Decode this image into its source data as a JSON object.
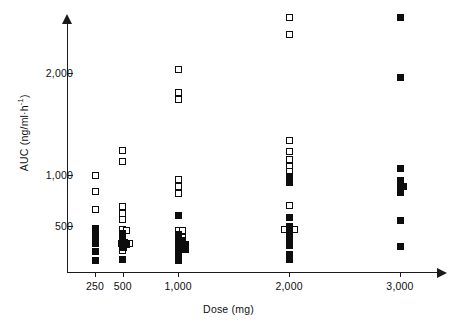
{
  "chart_data": {
    "type": "scatter",
    "title": "",
    "xlabel": "Dose (mg)",
    "ylabel": "AUC (ng/ml·h⁻¹)",
    "ylabel_parts": {
      "main": "AUC (ng/ml·h",
      "exponent": "-1",
      "close": ")"
    },
    "xlim": [
      0,
      3400
    ],
    "ylim": [
      0,
      2700
    ],
    "grid": false,
    "legend": null,
    "x_ticks": [
      {
        "value": 250,
        "label": "250"
      },
      {
        "value": 500,
        "label": "500"
      },
      {
        "value": 1000,
        "label": "1,000"
      },
      {
        "value": 2000,
        "label": "2,000"
      },
      {
        "value": 3000,
        "label": "3,000"
      }
    ],
    "y_ticks": [
      {
        "value": 500,
        "label": "500"
      },
      {
        "value": 1000,
        "label": "1,000"
      },
      {
        "value": 2000,
        "label": "2,000"
      }
    ],
    "marker_types": {
      "open": "open-square",
      "filled": "filled-square"
    },
    "series": [
      {
        "name": "open-square",
        "marker": "open",
        "points": [
          {
            "dose": 250,
            "auc": 1000
          },
          {
            "dose": 250,
            "auc": 840
          },
          {
            "dose": 250,
            "auc": 660
          },
          {
            "dose": 250,
            "auc": 475
          },
          {
            "dose": 250,
            "auc": 325
          },
          {
            "dose": 500,
            "auc": 1240
          },
          {
            "dose": 500,
            "auc": 1135
          },
          {
            "dose": 500,
            "auc": 690
          },
          {
            "dose": 500,
            "auc": 625
          },
          {
            "dose": 500,
            "auc": 560
          },
          {
            "dose": 500,
            "auc": 470
          },
          {
            "dose": 530,
            "auc": 455
          },
          {
            "dose": 560,
            "auc": 330
          },
          {
            "dose": 500,
            "auc": 255
          },
          {
            "dose": 1000,
            "auc": 2035
          },
          {
            "dose": 1000,
            "auc": 1810
          },
          {
            "dose": 1000,
            "auc": 1745
          },
          {
            "dose": 1000,
            "auc": 960
          },
          {
            "dose": 1000,
            "auc": 890
          },
          {
            "dose": 1000,
            "auc": 820
          },
          {
            "dose": 1000,
            "auc": 455
          },
          {
            "dose": 1040,
            "auc": 455
          },
          {
            "dose": 1000,
            "auc": 390
          },
          {
            "dose": 1035,
            "auc": 390
          },
          {
            "dose": 2000,
            "auc": 2540
          },
          {
            "dose": 2000,
            "auc": 2380
          },
          {
            "dose": 2000,
            "auc": 1340
          },
          {
            "dose": 2000,
            "auc": 1230
          },
          {
            "dose": 2000,
            "auc": 1155
          },
          {
            "dose": 2000,
            "auc": 1080
          },
          {
            "dose": 2000,
            "auc": 1030
          },
          {
            "dose": 2000,
            "auc": 700
          },
          {
            "dose": 1955,
            "auc": 465
          },
          {
            "dose": 2050,
            "auc": 465
          }
        ]
      },
      {
        "name": "filled-square",
        "marker": "filled",
        "points": [
          {
            "dose": 250,
            "auc": 470
          },
          {
            "dose": 250,
            "auc": 405
          },
          {
            "dose": 250,
            "auc": 340
          },
          {
            "dose": 250,
            "auc": 250
          },
          {
            "dose": 250,
            "auc": 165
          },
          {
            "dose": 500,
            "auc": 430
          },
          {
            "dose": 500,
            "auc": 395
          },
          {
            "dose": 500,
            "auc": 350
          },
          {
            "dose": 515,
            "auc": 335
          },
          {
            "dose": 490,
            "auc": 325
          },
          {
            "dose": 530,
            "auc": 320
          },
          {
            "dose": 500,
            "auc": 300
          },
          {
            "dose": 505,
            "auc": 290
          },
          {
            "dose": 500,
            "auc": 170
          },
          {
            "dose": 1000,
            "auc": 600
          },
          {
            "dose": 1000,
            "auc": 420
          },
          {
            "dose": 1000,
            "auc": 370
          },
          {
            "dose": 1035,
            "auc": 360
          },
          {
            "dose": 1000,
            "auc": 320
          },
          {
            "dose": 1035,
            "auc": 315
          },
          {
            "dose": 1065,
            "auc": 315
          },
          {
            "dose": 1000,
            "auc": 265
          },
          {
            "dose": 1035,
            "auc": 265
          },
          {
            "dose": 1065,
            "auc": 265
          },
          {
            "dose": 1000,
            "auc": 210
          },
          {
            "dose": 1000,
            "auc": 160
          },
          {
            "dose": 2000,
            "auc": 985
          },
          {
            "dose": 2000,
            "auc": 930
          },
          {
            "dose": 2000,
            "auc": 580
          },
          {
            "dose": 2000,
            "auc": 500
          },
          {
            "dose": 2000,
            "auc": 460
          },
          {
            "dose": 2000,
            "auc": 415
          },
          {
            "dose": 2000,
            "auc": 380
          },
          {
            "dose": 2000,
            "auc": 350
          },
          {
            "dose": 2000,
            "auc": 310
          },
          {
            "dose": 2000,
            "auc": 220
          },
          {
            "dose": 2000,
            "auc": 175
          },
          {
            "dose": 3000,
            "auc": 2540
          },
          {
            "dose": 3000,
            "auc": 1960
          },
          {
            "dose": 3000,
            "auc": 1060
          },
          {
            "dose": 3000,
            "auc": 945
          },
          {
            "dose": 3000,
            "auc": 890
          },
          {
            "dose": 3035,
            "auc": 890
          },
          {
            "dose": 3000,
            "auc": 830
          },
          {
            "dose": 3000,
            "auc": 555
          },
          {
            "dose": 3000,
            "auc": 300
          }
        ]
      }
    ]
  }
}
